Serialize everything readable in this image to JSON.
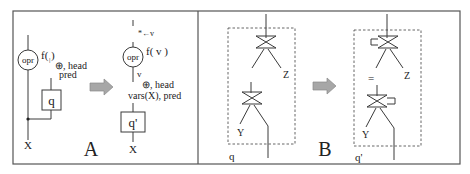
{
  "figure": {
    "panels": [
      {
        "id": "A",
        "label": "A",
        "before": {
          "operator_label": "opr",
          "function_label": "f(  )",
          "function_cursor": "|",
          "annotation_line1": "⊕, head",
          "annotation_line2": "pred",
          "subquery_label": "q",
          "output_label": "X"
        },
        "after": {
          "assignment_label": "*←v",
          "operator_label": "opr",
          "function_label": "f( v )",
          "edge_label": "v",
          "annotation_line1": "⊕, head",
          "annotation_line2": "vars(X), pred",
          "subquery_label": "q'",
          "output_label": "X"
        }
      },
      {
        "id": "B",
        "label": "B",
        "before": {
          "top_join_output": "Z",
          "bottom_join_output": "Y",
          "subquery_label": "q"
        },
        "after": {
          "top_join_output": "Z",
          "equality_label": "=",
          "bottom_join_output": "Y",
          "subquery_label": "q'"
        }
      }
    ],
    "colors": {
      "line": "#3a3a3a",
      "arrow_fill": "#a7a7a7",
      "background": "#ffffff"
    }
  }
}
